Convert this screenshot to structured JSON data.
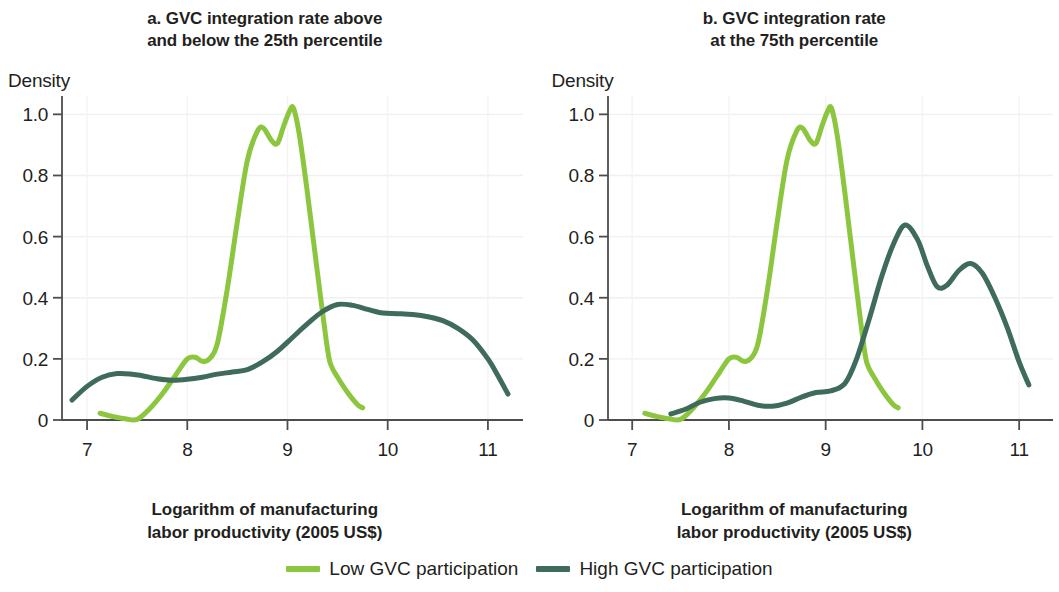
{
  "figure": {
    "background": "#ffffff",
    "text_color": "#231f20"
  },
  "panels": [
    {
      "id": "a",
      "title": "a. GVC integration rate above\nand below the 25th percentile",
      "y_axis_title": "Density",
      "x_axis_title": "Logarithm of manufacturing\nlabor productivity (2005 US$)"
    },
    {
      "id": "b",
      "title": "b. GVC integration rate\nat the 75th percentile",
      "y_axis_title": "Density",
      "x_axis_title": "Logarithm of manufacturing\nlabor productivity (2005 US$)"
    }
  ],
  "legend": {
    "items": [
      {
        "label": "Low GVC participation",
        "color": "#8cc63f"
      },
      {
        "label": "High GVC participation",
        "color": "#3f6b5b"
      }
    ]
  },
  "chart_data": [
    {
      "type": "line",
      "panel": "a",
      "title": "a. GVC integration rate above and below the 25th percentile",
      "xlabel": "Logarithm of manufacturing labor productivity (2005 US$)",
      "ylabel": "Density",
      "xlim": [
        6.75,
        11.35
      ],
      "ylim": [
        0,
        1.06
      ],
      "xticks": [
        7,
        8,
        9,
        10,
        11
      ],
      "yticks": [
        0,
        0.2,
        0.4,
        0.6,
        0.8,
        1.0
      ],
      "ytick_labels": [
        "0",
        "0.2",
        "0.4",
        "0.6",
        "0.8",
        "1.0"
      ],
      "grid": true,
      "legend_position": "bottom",
      "series": [
        {
          "name": "Low GVC participation",
          "color": "#8cc63f",
          "x": [
            7.13,
            7.25,
            7.38,
            7.5,
            7.62,
            7.75,
            7.88,
            8.0,
            8.08,
            8.15,
            8.22,
            8.3,
            8.4,
            8.5,
            8.6,
            8.7,
            8.76,
            8.84,
            8.9,
            8.96,
            9.02,
            9.06,
            9.12,
            9.2,
            9.3,
            9.4,
            9.44,
            9.5,
            9.6,
            9.7,
            9.75
          ],
          "y": [
            0.022,
            0.012,
            0.004,
            0.002,
            0.035,
            0.085,
            0.145,
            0.2,
            0.205,
            0.192,
            0.2,
            0.25,
            0.43,
            0.65,
            0.85,
            0.945,
            0.955,
            0.915,
            0.905,
            0.96,
            1.01,
            1.02,
            0.93,
            0.74,
            0.48,
            0.23,
            0.175,
            0.14,
            0.09,
            0.05,
            0.04
          ]
        },
        {
          "name": "High GVC participation",
          "color": "#3f6b5b",
          "x": [
            6.85,
            7.0,
            7.15,
            7.3,
            7.45,
            7.55,
            7.7,
            7.85,
            8.0,
            8.15,
            8.3,
            8.45,
            8.6,
            8.75,
            8.9,
            9.05,
            9.2,
            9.35,
            9.5,
            9.65,
            9.8,
            9.95,
            10.1,
            10.25,
            10.4,
            10.55,
            10.7,
            10.85,
            11.0,
            11.1,
            11.2
          ],
          "y": [
            0.065,
            0.11,
            0.14,
            0.152,
            0.15,
            0.145,
            0.135,
            0.13,
            0.133,
            0.14,
            0.15,
            0.157,
            0.165,
            0.19,
            0.225,
            0.27,
            0.315,
            0.355,
            0.378,
            0.375,
            0.362,
            0.35,
            0.348,
            0.345,
            0.338,
            0.325,
            0.3,
            0.262,
            0.2,
            0.145,
            0.085
          ]
        }
      ]
    },
    {
      "type": "line",
      "panel": "b",
      "title": "b. GVC integration rate at the 75th percentile",
      "xlabel": "Logarithm of manufacturing labor productivity (2005 US$)",
      "ylabel": "Density",
      "xlim": [
        6.75,
        11.35
      ],
      "ylim": [
        0,
        1.06
      ],
      "xticks": [
        7,
        8,
        9,
        10,
        11
      ],
      "yticks": [
        0,
        0.2,
        0.4,
        0.6,
        0.8,
        1.0
      ],
      "ytick_labels": [
        "0",
        "0.2",
        "0.4",
        "0.6",
        "0.8",
        "1.0"
      ],
      "grid": true,
      "legend_position": "bottom",
      "series": [
        {
          "name": "Low GVC participation",
          "color": "#8cc63f",
          "x": [
            7.13,
            7.25,
            7.38,
            7.5,
            7.62,
            7.75,
            7.88,
            8.0,
            8.08,
            8.15,
            8.22,
            8.3,
            8.4,
            8.5,
            8.6,
            8.7,
            8.76,
            8.84,
            8.9,
            8.96,
            9.02,
            9.06,
            9.12,
            9.2,
            9.3,
            9.4,
            9.44,
            9.5,
            9.6,
            9.7,
            9.75
          ],
          "y": [
            0.022,
            0.012,
            0.004,
            0.002,
            0.035,
            0.085,
            0.145,
            0.2,
            0.205,
            0.192,
            0.2,
            0.25,
            0.43,
            0.65,
            0.85,
            0.945,
            0.955,
            0.915,
            0.905,
            0.96,
            1.01,
            1.02,
            0.93,
            0.74,
            0.48,
            0.23,
            0.175,
            0.14,
            0.09,
            0.05,
            0.04
          ]
        },
        {
          "name": "High GVC participation",
          "color": "#3f6b5b",
          "x": [
            7.4,
            7.55,
            7.7,
            7.85,
            8.0,
            8.15,
            8.3,
            8.45,
            8.6,
            8.75,
            8.9,
            9.05,
            9.2,
            9.32,
            9.45,
            9.58,
            9.7,
            9.82,
            9.95,
            10.05,
            10.15,
            10.25,
            10.38,
            10.5,
            10.62,
            10.75,
            10.88,
            11.0,
            11.1
          ],
          "y": [
            0.02,
            0.035,
            0.058,
            0.07,
            0.072,
            0.062,
            0.048,
            0.045,
            0.055,
            0.075,
            0.09,
            0.095,
            0.12,
            0.2,
            0.33,
            0.47,
            0.575,
            0.638,
            0.59,
            0.505,
            0.437,
            0.44,
            0.49,
            0.512,
            0.48,
            0.4,
            0.3,
            0.19,
            0.115
          ]
        }
      ]
    }
  ]
}
